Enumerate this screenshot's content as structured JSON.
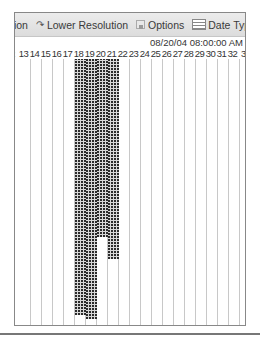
{
  "toolbar": {
    "partial_label": "tion",
    "lower_resolution": {
      "label": "Lower Resolution",
      "icon": "arrow-icon"
    },
    "options": {
      "label": "Options",
      "icon": "options-icon"
    },
    "date_type": {
      "label": "Date Type",
      "icon": "calendar-list-icon",
      "caret": "▼"
    }
  },
  "timeline": {
    "date_label": "08/20/04 08:00:00 AM",
    "columns": [
      "2",
      "13",
      "14",
      "15",
      "16",
      "17",
      "18",
      "19",
      "20",
      "21",
      "22",
      "23",
      "24",
      "25",
      "26",
      "27",
      "28",
      "29",
      "30",
      "31",
      "32",
      "3"
    ]
  },
  "bars": [
    {
      "column": "18",
      "start_y": 56,
      "end_y": 314
    },
    {
      "column": "19",
      "start_y": 56,
      "end_y": 318
    },
    {
      "column": "20",
      "start_y": 56,
      "end_y": 236
    },
    {
      "column": "21",
      "start_y": 56,
      "end_y": 258
    }
  ],
  "colors": {
    "toolbar_bg": "#e2e2e2",
    "bar_fill": "#2b2b2b",
    "grid_line": "#c8c8c8",
    "border": "#888888"
  }
}
